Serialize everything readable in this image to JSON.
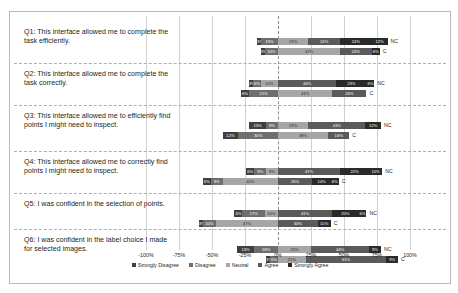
{
  "chart_data": {
    "type": "bar",
    "subtype": "diverging-stacked-likert",
    "title": "",
    "xlabel": "",
    "ylabel": "",
    "xlim": [
      -100,
      100
    ],
    "xticks": [
      "-100%",
      "-75%",
      "-50%",
      "-25%",
      "0%",
      "25%",
      "50%",
      "75%",
      "100%"
    ],
    "xtick_values": [
      -100,
      -75,
      -50,
      -25,
      0,
      25,
      50,
      75,
      100
    ],
    "grid": true,
    "zero_reference_line": true,
    "legend_position": "bottom",
    "legend": [
      "Strongly Disagree",
      "Disagree",
      "Neutral",
      "Agree",
      "Strongly Agree"
    ],
    "colors": [
      "#3f3f3f",
      "#6e6e6e",
      "#a6a6a6",
      "#5a5a5a",
      "#2a2a2a"
    ],
    "series_labels": [
      "NC",
      "C"
    ],
    "categories": [
      "Q1: This interface allowed me to complete the task efficiently.",
      "Q2: This interface allowed me to complete the task correctly.",
      "Q3: This interface allowed me to efficiently find points I might need to inspect.",
      "Q4: This interface allowed me to correctly find points I might need to inspect.",
      "Q5: I was confident in the selection of points.",
      "Q6: I was confident in the label choice I made for selected images."
    ],
    "rows": [
      {
        "question": "Q1",
        "bars": [
          {
            "label": "NC",
            "values": [
              3,
              13,
              23,
              24,
              24,
              12
            ],
            "segments": [
              {
                "name": "Strongly Disagree",
                "value": 3,
                "text": "3%"
              },
              {
                "name": "Disagree",
                "value": 13,
                "text": "13%"
              },
              {
                "name": "Neutral",
                "value": 23,
                "text": "23%"
              },
              {
                "name": "Agree",
                "value": 24,
                "text": "24%"
              },
              {
                "name": "Strongly Agree",
                "value": 24,
                "text": "24%"
              },
              {
                "name": "Strongly Agree Extra",
                "value": 12,
                "text": "12%"
              }
            ]
          },
          {
            "label": "C",
            "values": [
              3,
              10,
              47,
              24,
              6
            ],
            "segments": [
              {
                "name": "Strongly Disagree",
                "value": 3,
                "text": "3%"
              },
              {
                "name": "Disagree",
                "value": 10,
                "text": "10%"
              },
              {
                "name": "Neutral",
                "value": 47,
                "text": "47%"
              },
              {
                "name": "Agree",
                "value": 24,
                "text": "24%"
              },
              {
                "name": "Strongly Agree",
                "value": 6,
                "text": "6%"
              }
            ]
          }
        ]
      },
      {
        "question": "Q2",
        "bars": [
          {
            "label": "NC",
            "values": [
              3,
              6,
              13,
              44,
              23,
              6
            ],
            "segments": [
              {
                "name": "Strongly Disagree",
                "value": 3,
                "text": "3%"
              },
              {
                "name": "Disagree",
                "value": 6,
                "text": "6%"
              },
              {
                "name": "Neutral",
                "value": 13,
                "text": "13%"
              },
              {
                "name": "Agree",
                "value": 44,
                "text": "44%"
              },
              {
                "name": "Strongly Agree",
                "value": 23,
                "text": "23%"
              },
              {
                "name": "Strongly Agree Extra",
                "value": 6,
                "text": "6%"
              }
            ]
          },
          {
            "label": "C",
            "values": [
              6,
              22,
              41,
              26
            ],
            "segments": [
              {
                "name": "Strongly Disagree",
                "value": 6,
                "text": "6%"
              },
              {
                "name": "Disagree",
                "value": 22,
                "text": "22%"
              },
              {
                "name": "Neutral",
                "value": 41,
                "text": "41%"
              },
              {
                "name": "Agree",
                "value": 26,
                "text": "26%"
              }
            ]
          }
        ]
      },
      {
        "question": "Q3",
        "bars": [
          {
            "label": "NC",
            "values": [
              13,
              9,
              23,
              43,
              12
            ],
            "segments": [
              {
                "name": "Disagree",
                "value": 13,
                "text": "13%"
              },
              {
                "name": "Neutral",
                "value": 9,
                "text": "9%"
              },
              {
                "name": "Neutral2",
                "value": 23,
                "text": "23%"
              },
              {
                "name": "Agree",
                "value": 43,
                "text": "43%"
              },
              {
                "name": "Strongly Agree",
                "value": 12,
                "text": "12%"
              }
            ]
          },
          {
            "label": "C",
            "values": [
              12,
              30,
              38,
              16
            ],
            "segments": [
              {
                "name": "Disagree",
                "value": 12,
                "text": "12%"
              },
              {
                "name": "Neutral",
                "value": 30,
                "text": "30%"
              },
              {
                "name": "Agree",
                "value": 38,
                "text": "38%"
              },
              {
                "name": "Strongly Agree",
                "value": 16,
                "text": "16%"
              }
            ]
          }
        ]
      },
      {
        "question": "Q4",
        "bars": [
          {
            "label": "NC",
            "values": [
              6,
              9,
              9,
              47,
              22,
              10
            ],
            "segments": [
              {
                "name": "Strongly Disagree",
                "value": 6,
                "text": "6%"
              },
              {
                "name": "Disagree",
                "value": 9,
                "text": "9%"
              },
              {
                "name": "Neutral",
                "value": 9,
                "text": "9%"
              },
              {
                "name": "Agree",
                "value": 47,
                "text": "47%"
              },
              {
                "name": "Strongly Agree",
                "value": 22,
                "text": "22%"
              },
              {
                "name": "Strongly Agree Extra",
                "value": 10,
                "text": "10%"
              }
            ]
          },
          {
            "label": "C",
            "values": [
              6,
              9,
              42,
              26,
              14,
              6
            ],
            "segments": [
              {
                "name": "Strongly Disagree",
                "value": 6,
                "text": "6%"
              },
              {
                "name": "Disagree",
                "value": 9,
                "text": "9%"
              },
              {
                "name": "Neutral",
                "value": 42,
                "text": "42%"
              },
              {
                "name": "Agree",
                "value": 26,
                "text": "26%"
              },
              {
                "name": "Strongly Agree",
                "value": 14,
                "text": "14%"
              },
              {
                "name": "Strongly Agree Extra",
                "value": 6,
                "text": "6%"
              }
            ]
          }
        ]
      },
      {
        "question": "Q5",
        "bars": [
          {
            "label": "NC",
            "values": [
              6,
              17,
              10,
              41,
              20,
              6
            ],
            "segments": [
              {
                "name": "Strongly Disagree",
                "value": 6,
                "text": "6%"
              },
              {
                "name": "Disagree",
                "value": 17,
                "text": "17%"
              },
              {
                "name": "Neutral",
                "value": 10,
                "text": "10%"
              },
              {
                "name": "Agree",
                "value": 41,
                "text": "41%"
              },
              {
                "name": "Strongly Agree",
                "value": 20,
                "text": "20%"
              },
              {
                "name": "Strongly Agree Extra",
                "value": 6,
                "text": "6%"
              }
            ]
          },
          {
            "label": "C",
            "values": [
              3,
              10,
              47,
              30,
              10
            ],
            "segments": [
              {
                "name": "Strongly Disagree",
                "value": 3,
                "text": "3%"
              },
              {
                "name": "Disagree",
                "value": 10,
                "text": "10%"
              },
              {
                "name": "Neutral",
                "value": 47,
                "text": "47%"
              },
              {
                "name": "Agree",
                "value": 30,
                "text": "30%"
              },
              {
                "name": "Strongly Agree",
                "value": 10,
                "text": "10%"
              }
            ]
          }
        ]
      },
      {
        "question": "Q6",
        "bars": [
          {
            "label": "NC",
            "values": [
              13,
              18,
              25,
              44,
              9
            ],
            "segments": [
              {
                "name": "Strongly Disagree",
                "value": 13,
                "text": "13%"
              },
              {
                "name": "Disagree",
                "value": 18,
                "text": "18%"
              },
              {
                "name": "Neutral",
                "value": 25,
                "text": "25%"
              },
              {
                "name": "Agree",
                "value": 44,
                "text": "44%"
              },
              {
                "name": "Strongly Agree",
                "value": 9,
                "text": "9%"
              }
            ]
          },
          {
            "label": "C",
            "values": [
              3,
              6,
              21,
              61,
              9
            ],
            "segments": [
              {
                "name": "Strongly Disagree",
                "value": 3,
                "text": "3%"
              },
              {
                "name": "Disagree",
                "value": 6,
                "text": "6%"
              },
              {
                "name": "Neutral",
                "value": 21,
                "text": "21%"
              },
              {
                "name": "Agree",
                "value": 61,
                "text": "61%"
              },
              {
                "name": "Strongly Agree",
                "value": 9,
                "text": "9%"
              }
            ]
          }
        ]
      }
    ]
  }
}
